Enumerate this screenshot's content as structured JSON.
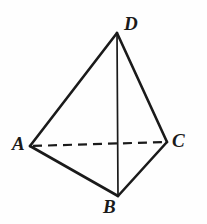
{
  "figure": {
    "name": "tetrahedron-abcd",
    "background_color": "#fefefe",
    "stroke_color": "#1a1a1a",
    "canvas": {
      "width": 207,
      "height": 224
    }
  },
  "labels": {
    "A": "A",
    "B": "B",
    "C": "C",
    "D": "D"
  },
  "geometry": {
    "vertices": [
      {
        "id": "A",
        "x": 30,
        "y": 146
      },
      {
        "id": "B",
        "x": 118,
        "y": 196
      },
      {
        "id": "C",
        "x": 167,
        "y": 142
      },
      {
        "id": "D",
        "x": 117,
        "y": 33
      }
    ],
    "edges": [
      {
        "id": "DA",
        "from": "D",
        "to": "A",
        "style": "solid",
        "width": 2.6
      },
      {
        "id": "DC",
        "from": "D",
        "to": "C",
        "style": "solid",
        "width": 2.6
      },
      {
        "id": "AB",
        "from": "A",
        "to": "B",
        "style": "solid",
        "width": 2.6
      },
      {
        "id": "BC",
        "from": "B",
        "to": "C",
        "style": "solid",
        "width": 2.6
      },
      {
        "id": "DB",
        "from": "D",
        "to": "B",
        "style": "solid",
        "width": 1.7
      },
      {
        "id": "AC",
        "from": "A",
        "to": "C",
        "style": "dashed",
        "width": 2.2,
        "dash": "9 6"
      }
    ]
  }
}
